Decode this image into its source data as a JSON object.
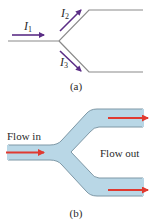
{
  "diagram_a": {
    "caption": "(a)",
    "labels": {
      "i1": {
        "main": "I",
        "sub": "1"
      },
      "i2": {
        "main": "I",
        "sub": "2"
      },
      "i3": {
        "main": "I",
        "sub": "3"
      }
    },
    "colors": {
      "wire": "#8a8a8a",
      "arrow": "#5b2d86"
    }
  },
  "diagram_b": {
    "caption": "(b)",
    "flow_in_label": "Flow in",
    "flow_out_label": "Flow out",
    "colors": {
      "pipe_fill": "#b9d7e6",
      "pipe_edge": "#7e98a6",
      "arrow": "#e03a30"
    }
  }
}
